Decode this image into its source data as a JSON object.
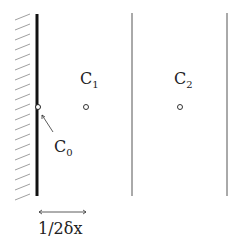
{
  "diagram": {
    "wall": {
      "label": "wall",
      "hatch_color": "#9a9a9a",
      "color": "#111111"
    },
    "cells": [
      {
        "name": "C",
        "sub": "0"
      },
      {
        "name": "C",
        "sub": "1"
      },
      {
        "name": "C",
        "sub": "2"
      }
    ],
    "dimension": {
      "label": "1/2δx"
    },
    "colors": {
      "line": "#555555",
      "thick": "#111111",
      "text": "#222222"
    }
  }
}
